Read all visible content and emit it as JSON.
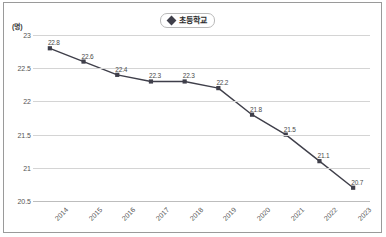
{
  "figure": {
    "border_color": "#9a9a9a",
    "background": "#ffffff"
  },
  "legend": {
    "label": "초등학교",
    "marker": "diamond-marker",
    "position": "top-center",
    "border_color": "#b9b9b9"
  },
  "axes": {
    "y_unit_label": "(명)",
    "y_tick_labels": [
      "23",
      "22.5",
      "22",
      "21.5",
      "21",
      "20.5"
    ],
    "x_tick_labels": [
      "2014",
      "2015",
      "2016",
      "2017",
      "2018",
      "2019",
      "2020",
      "2021",
      "2022",
      "2023"
    ]
  },
  "chart_data": {
    "type": "line",
    "title": "",
    "subtitle": "",
    "xlabel": "",
    "ylabel": "(명)",
    "categories": [
      "2014",
      "2015",
      "2016",
      "2017",
      "2018",
      "2019",
      "2020",
      "2021",
      "2022",
      "2023"
    ],
    "series": [
      {
        "name": "초등학교",
        "values": [
          22.8,
          22.6,
          22.4,
          22.3,
          22.3,
          22.2,
          21.8,
          21.5,
          21.1,
          20.7
        ],
        "color": "#3f3f4a",
        "marker": "square"
      }
    ],
    "data_labels": [
      "22.8",
      "22.6",
      "22.4",
      "22.3",
      "22.3",
      "22.2",
      "21.8",
      "21.5",
      "21.1",
      "20.7"
    ],
    "ylim": [
      20.5,
      23.0
    ],
    "y_ticks": [
      23,
      22.5,
      22,
      21.5,
      21,
      20.5
    ],
    "grid": true,
    "grid_color": "#d4d4d4",
    "legend_position": "top-center"
  }
}
